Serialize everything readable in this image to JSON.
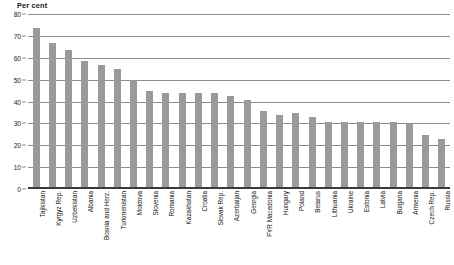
{
  "chart": {
    "axis_caption": "Per cent",
    "bar_color": "#9a9a9a",
    "grid_color": "#8d8d8d",
    "axis_color": "#3a3a3a"
  },
  "chart_data": {
    "type": "bar",
    "title": "",
    "subtitle": "",
    "xlabel": "",
    "ylabel": "Per cent",
    "ylim": [
      0,
      80
    ],
    "ytick_labels": [
      "0",
      "10",
      "20",
      "30",
      "40",
      "50",
      "60",
      "70",
      "80"
    ],
    "yticks": [
      0,
      10,
      20,
      30,
      40,
      50,
      60,
      70,
      80
    ],
    "grid": true,
    "legend": false,
    "legend_position": "none",
    "categories": [
      "Tajikistan",
      "Kyrgyz Rep.",
      "Uzbekistan",
      "Albania",
      "Bosnia and Herz.",
      "Turkmenistan",
      "Moldova",
      "Slovenia",
      "Romania",
      "Kazakhstan",
      "Croatia",
      "Slovak Rep.",
      "Azerbaijan",
      "Georgia",
      "FYR Macedonia",
      "Hungary",
      "Poland",
      "Belarus",
      "Lithuania",
      "Ukraine",
      "Estonia",
      "Latvia",
      "Bulgaria",
      "Armenia",
      "Czech Rep.",
      "Russia"
    ],
    "values": [
      73,
      66,
      63,
      58,
      56,
      54,
      49,
      44,
      43,
      43,
      43,
      43,
      42,
      40,
      35,
      33,
      34,
      32,
      30,
      30,
      30,
      30,
      30,
      29,
      24,
      22
    ]
  }
}
